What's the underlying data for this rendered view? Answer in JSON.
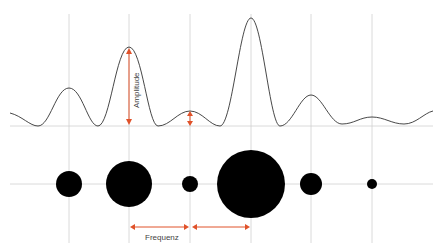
{
  "labels": {
    "amplitude": "Amplitude",
    "frequency": "Frequenz"
  },
  "colors": {
    "grid": "#d0d0d0",
    "wave": "#333333",
    "arrow": "#e0522a",
    "dot": "#000000"
  },
  "grid_x": [
    69,
    129,
    190,
    251,
    311,
    372
  ],
  "wave": {
    "baseline_y": 126,
    "peaks": [
      {
        "x": 69,
        "y": 88
      },
      {
        "x": 129,
        "y": 47
      },
      {
        "x": 190,
        "y": 111
      },
      {
        "x": 251,
        "y": 18
      },
      {
        "x": 311,
        "y": 95
      },
      {
        "x": 372,
        "y": 117
      }
    ]
  },
  "dots": {
    "center_y": 184,
    "items": [
      {
        "x": 69,
        "r": 13
      },
      {
        "x": 129,
        "r": 23
      },
      {
        "x": 190,
        "r": 8
      },
      {
        "x": 251,
        "r": 34
      },
      {
        "x": 311,
        "r": 11
      },
      {
        "x": 372,
        "r": 5
      }
    ]
  }
}
